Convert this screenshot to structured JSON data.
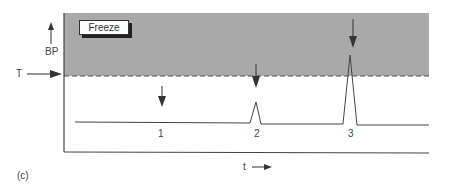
{
  "figure": {
    "panel_label": "(c)",
    "box_label": "Freeze",
    "y_axis_label": "BP",
    "threshold_label": "T",
    "x_axis_label": "t",
    "events": [
      {
        "id": "1",
        "label": "1",
        "peak": "none"
      },
      {
        "id": "2",
        "label": "2",
        "peak": "small, below threshold"
      },
      {
        "id": "3",
        "label": "3",
        "peak": "large, exceeds threshold"
      }
    ],
    "colors": {
      "freeze_region": "#a9a9a9",
      "line": "#444444",
      "dashed_threshold": "#555555"
    }
  }
}
